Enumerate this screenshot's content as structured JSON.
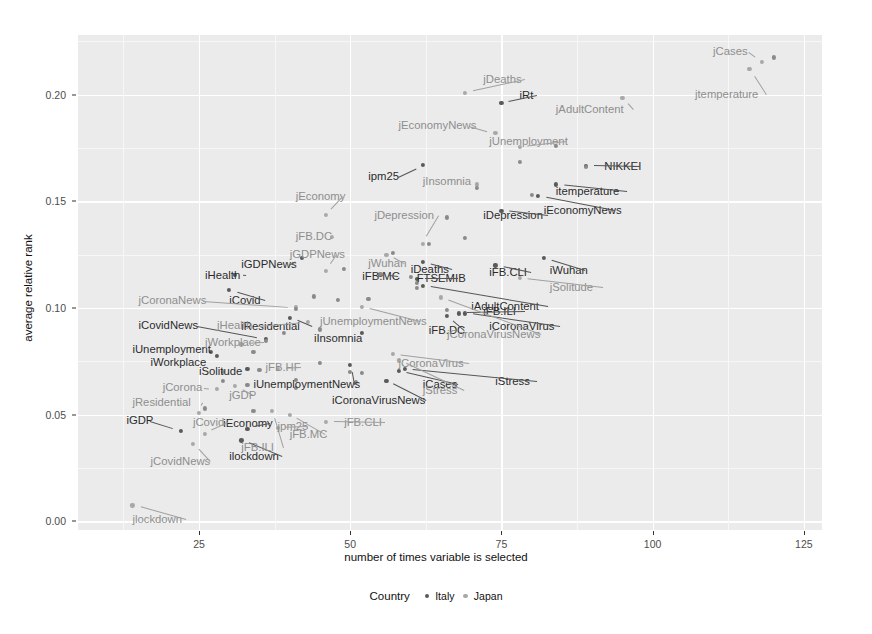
{
  "chart_data": {
    "type": "scatter",
    "title": "",
    "xlabel": "number of times variable is selected",
    "ylabel": "average relative rank",
    "xlim": [
      5,
      128
    ],
    "ylim": [
      -0.004,
      0.228
    ],
    "xticks": [
      25,
      50,
      75,
      100,
      125
    ],
    "yticks": [
      "0.00",
      "0.05",
      "0.10",
      "0.15",
      "0.20"
    ],
    "grid": true,
    "legend": {
      "title": "Country",
      "position": "bottom",
      "entries": [
        {
          "name": "Italy",
          "color": "#5a5a5a"
        },
        {
          "name": "Japan",
          "color": "#a8a8a8"
        }
      ]
    },
    "series": [
      {
        "name": "Italy",
        "color": "#5a5a5a",
        "points": [
          {
            "label": "iCases",
            "x": 58,
            "y": 0.0705,
            "lx": 62,
            "ly": 0.064,
            "anchor": "l"
          },
          {
            "label": "iStress",
            "x": 59,
            "y": 0.0715,
            "lx": 74,
            "ly": 0.0655,
            "anchor": "l"
          },
          {
            "label": "iCoronaVirusNews",
            "x": 56,
            "y": 0.066,
            "lx": 47,
            "ly": 0.0565,
            "anchor": "l"
          },
          {
            "label": "iUnemploymentNews",
            "x": 50,
            "y": 0.0735,
            "lx": 34,
            "ly": 0.064,
            "anchor": "l"
          },
          {
            "label": "iEconomy",
            "x": 33,
            "y": 0.0435,
            "lx": 29,
            "ly": 0.0455,
            "anchor": "l"
          },
          {
            "label": "iGDP",
            "x": 22,
            "y": 0.0425,
            "lx": 13,
            "ly": 0.047,
            "anchor": "l"
          },
          {
            "label": "ilockdown",
            "x": 32,
            "y": 0.038,
            "lx": 30,
            "ly": 0.03,
            "anchor": "l"
          },
          {
            "label": "iCovid",
            "x": 30,
            "y": 0.1085,
            "lx": 30,
            "ly": 0.1035,
            "anchor": "l"
          },
          {
            "label": "iHealth",
            "x": 31,
            "y": 0.1155,
            "lx": 26,
            "ly": 0.115,
            "anchor": "l"
          },
          {
            "label": "iGDPNews",
            "x": 42,
            "y": 0.1235,
            "lx": 32,
            "ly": 0.12,
            "anchor": "l"
          },
          {
            "label": "iResidential",
            "x": 40,
            "y": 0.0955,
            "lx": 32,
            "ly": 0.091,
            "anchor": "l"
          },
          {
            "label": "iInsomnia",
            "x": 52,
            "y": 0.0885,
            "lx": 44,
            "ly": 0.0855,
            "anchor": "l"
          },
          {
            "label": "iUnemployment",
            "x": 27,
            "y": 0.0795,
            "lx": 14,
            "ly": 0.0805,
            "anchor": "l"
          },
          {
            "label": "iWorkplace",
            "x": 28,
            "y": 0.0775,
            "lx": 17,
            "ly": 0.0745,
            "anchor": "l"
          },
          {
            "label": "iSolitude",
            "x": 33,
            "y": 0.0715,
            "lx": 25,
            "ly": 0.07,
            "anchor": "l"
          },
          {
            "label": "iCovidNews",
            "x": 36,
            "y": 0.0855,
            "lx": 15,
            "ly": 0.0915,
            "anchor": "l"
          },
          {
            "label": "iDeaths",
            "x": 62,
            "y": 0.1215,
            "lx": 60,
            "ly": 0.118,
            "anchor": "l"
          },
          {
            "label": "iAdultContent",
            "x": 62,
            "y": 0.1105,
            "lx": 70,
            "ly": 0.1005,
            "anchor": "l"
          },
          {
            "label": "iFB.ILI",
            "x": 68,
            "y": 0.0975,
            "lx": 72,
            "ly": 0.098,
            "anchor": "l"
          },
          {
            "label": "iFB.DC",
            "x": 66,
            "y": 0.0965,
            "lx": 63,
            "ly": 0.0895,
            "anchor": "l"
          },
          {
            "label": "iCoronaVirus",
            "x": 69,
            "y": 0.0975,
            "lx": 73,
            "ly": 0.091,
            "anchor": "l"
          },
          {
            "label": "iDepression",
            "x": 75,
            "y": 0.1455,
            "lx": 72,
            "ly": 0.143,
            "anchor": "l"
          },
          {
            "label": "iEconomyNews",
            "x": 81,
            "y": 0.1525,
            "lx": 82,
            "ly": 0.1455,
            "anchor": "l"
          },
          {
            "label": "itemperature",
            "x": 84,
            "y": 0.158,
            "lx": 84,
            "ly": 0.1545,
            "anchor": "l"
          },
          {
            "label": "iWuhan",
            "x": 82,
            "y": 0.1235,
            "lx": 83,
            "ly": 0.1175,
            "anchor": "l"
          },
          {
            "label": "iFB.CLI",
            "x": 74,
            "y": 0.12,
            "lx": 73,
            "ly": 0.1165,
            "anchor": "l"
          },
          {
            "label": "ipm25",
            "x": 62,
            "y": 0.167,
            "lx": 53,
            "ly": 0.1615,
            "anchor": "l"
          },
          {
            "label": "iRt",
            "x": 75,
            "y": 0.196,
            "lx": 78,
            "ly": 0.1995,
            "anchor": "l"
          },
          {
            "label": "iFB.MC",
            "x": 55,
            "y": 0.1155,
            "lx": 52,
            "ly": 0.1145,
            "anchor": "l"
          },
          {
            "label": "FTSEMIB",
            "x": 61,
            "y": 0.1135,
            "lx": 61,
            "ly": 0.1135,
            "anchor": "l"
          },
          {
            "label": "NIKKEI",
            "x": 89,
            "y": 0.1665,
            "lx": 92,
            "ly": 0.166,
            "anchor": "l"
          }
        ]
      },
      {
        "name": "Japan",
        "color": "#a8a8a8",
        "points": [
          {
            "label": "jlockdown",
            "x": 14,
            "y": 0.0075,
            "lx": 14,
            "ly": 0.0005,
            "anchor": "l"
          },
          {
            "label": "jCovidNews",
            "x": 24,
            "y": 0.0365,
            "lx": 17,
            "ly": 0.028,
            "anchor": "l"
          },
          {
            "label": "jCovid",
            "x": 26,
            "y": 0.041,
            "lx": 24,
            "ly": 0.046,
            "anchor": "l"
          },
          {
            "label": "jResidential",
            "x": 25,
            "y": 0.051,
            "lx": 14,
            "ly": 0.0555,
            "anchor": "l"
          },
          {
            "label": "jCorona",
            "x": 28,
            "y": 0.062,
            "lx": 19,
            "ly": 0.0625,
            "anchor": "l"
          },
          {
            "label": "jGDP",
            "x": 31,
            "y": 0.0635,
            "lx": 30,
            "ly": 0.059,
            "anchor": "l"
          },
          {
            "label": "jWorkplace",
            "x": 32,
            "y": 0.083,
            "lx": 26,
            "ly": 0.0835,
            "anchor": "l"
          },
          {
            "label": "jFB.HF",
            "x": 38,
            "y": 0.0715,
            "lx": 36,
            "ly": 0.072,
            "anchor": "l"
          },
          {
            "label": "jFB.ILI",
            "x": 37,
            "y": 0.052,
            "lx": 32,
            "ly": 0.0345,
            "anchor": "l"
          },
          {
            "label": "jFB.MC",
            "x": 40,
            "y": 0.05,
            "lx": 40,
            "ly": 0.0405,
            "anchor": "l"
          },
          {
            "label": "jpm25",
            "x": 38,
            "y": 0.044,
            "lx": 38,
            "ly": 0.0445,
            "anchor": "l"
          },
          {
            "label": "jFB.CLI",
            "x": 46,
            "y": 0.0465,
            "lx": 49,
            "ly": 0.046,
            "anchor": "l"
          },
          {
            "label": "jCases",
            "x": 118,
            "y": 0.2155,
            "lx": 110,
            "ly": 0.22,
            "anchor": "l"
          },
          {
            "label": "jtemperature",
            "x": 116,
            "y": 0.212,
            "lx": 107,
            "ly": 0.2,
            "anchor": "l"
          },
          {
            "label": "jAdultContent",
            "x": 95,
            "y": 0.1985,
            "lx": 84,
            "ly": 0.193,
            "anchor": "l"
          },
          {
            "label": "jDeaths",
            "x": 69,
            "y": 0.201,
            "lx": 72,
            "ly": 0.207,
            "anchor": "l"
          },
          {
            "label": "jEconomyNews",
            "x": 74,
            "y": 0.182,
            "lx": 58,
            "ly": 0.1855,
            "anchor": "l"
          },
          {
            "label": "jUnemployment",
            "x": 78,
            "y": 0.1755,
            "lx": 73,
            "ly": 0.178,
            "anchor": "l"
          },
          {
            "label": "jInsomnia",
            "x": 71,
            "y": 0.158,
            "lx": 62,
            "ly": 0.159,
            "anchor": "l"
          },
          {
            "label": "jDepression",
            "x": 62,
            "y": 0.13,
            "lx": 54,
            "ly": 0.143,
            "anchor": "l"
          },
          {
            "label": "jEconomy",
            "x": 46,
            "y": 0.1435,
            "lx": 41,
            "ly": 0.152,
            "anchor": "l"
          },
          {
            "label": "jFB.DC",
            "x": 47,
            "y": 0.1335,
            "lx": 41,
            "ly": 0.1335,
            "anchor": "l"
          },
          {
            "label": "jGDPNews",
            "x": 46,
            "y": 0.1175,
            "lx": 40,
            "ly": 0.125,
            "anchor": "l"
          },
          {
            "label": "jWuhan",
            "x": 56,
            "y": 0.125,
            "lx": 53,
            "ly": 0.1205,
            "anchor": "l"
          },
          {
            "label": "jCoronaNews",
            "x": 41,
            "y": 0.1005,
            "lx": 15,
            "ly": 0.1035,
            "anchor": "l"
          },
          {
            "label": "jHealth",
            "x": 43,
            "y": 0.0935,
            "lx": 28,
            "ly": 0.0915,
            "anchor": "l"
          },
          {
            "label": "jCoronaVirus",
            "x": 57,
            "y": 0.0785,
            "lx": 58,
            "ly": 0.074,
            "anchor": "l"
          },
          {
            "label": "jCoronaVirusNews",
            "x": 65,
            "y": 0.105,
            "lx": 66,
            "ly": 0.0875,
            "anchor": "l"
          },
          {
            "label": "jStress",
            "x": 58,
            "y": 0.0755,
            "lx": 62,
            "ly": 0.061,
            "anchor": "l"
          },
          {
            "label": "jSolitude",
            "x": 78,
            "y": 0.114,
            "lx": 83,
            "ly": 0.1095,
            "anchor": "l"
          },
          {
            "label": "jUnemploymentNews",
            "x": 52,
            "y": 0.1005,
            "lx": 45,
            "ly": 0.0935,
            "anchor": "l"
          }
        ]
      },
      {
        "name": "unlabeled",
        "color": "#8a8a8a",
        "points": [
          {
            "x": 120,
            "y": 0.2175
          },
          {
            "x": 84,
            "y": 0.176
          },
          {
            "x": 78,
            "y": 0.1685
          },
          {
            "x": 89,
            "y": 0.166
          },
          {
            "x": 80,
            "y": 0.153
          },
          {
            "x": 71,
            "y": 0.1565
          },
          {
            "x": 66,
            "y": 0.1425
          },
          {
            "x": 69,
            "y": 0.133
          },
          {
            "x": 63,
            "y": 0.13
          },
          {
            "x": 57,
            "y": 0.126
          },
          {
            "x": 49,
            "y": 0.1185
          },
          {
            "x": 55,
            "y": 0.116
          },
          {
            "x": 60,
            "y": 0.1145
          },
          {
            "x": 61,
            "y": 0.112
          },
          {
            "x": 61,
            "y": 0.1095
          },
          {
            "x": 53,
            "y": 0.1045
          },
          {
            "x": 48,
            "y": 0.104
          },
          {
            "x": 44,
            "y": 0.1055
          },
          {
            "x": 41,
            "y": 0.0995
          },
          {
            "x": 45,
            "y": 0.09
          },
          {
            "x": 39,
            "y": 0.0885
          },
          {
            "x": 36,
            "y": 0.0845
          },
          {
            "x": 34,
            "y": 0.0795
          },
          {
            "x": 29,
            "y": 0.07
          },
          {
            "x": 29,
            "y": 0.066
          },
          {
            "x": 35,
            "y": 0.071
          },
          {
            "x": 33,
            "y": 0.064
          },
          {
            "x": 41,
            "y": 0.0665
          },
          {
            "x": 41,
            "y": 0.0625
          },
          {
            "x": 45,
            "y": 0.0745
          },
          {
            "x": 26,
            "y": 0.053
          },
          {
            "x": 34,
            "y": 0.052
          },
          {
            "x": 50,
            "y": 0.07
          },
          {
            "x": 52,
            "y": 0.0695
          },
          {
            "x": 51,
            "y": 0.0655
          },
          {
            "x": 66,
            "y": 0.099
          }
        ]
      }
    ]
  }
}
